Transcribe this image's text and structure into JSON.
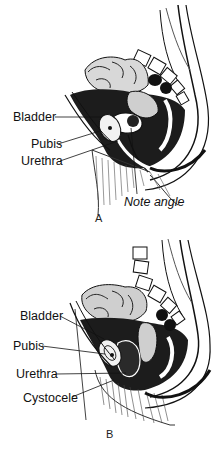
{
  "figures": [
    {
      "id": "A",
      "caption": "A",
      "description": "Sagittal section of the female pelvis showing normal anatomy",
      "labels": {
        "bladder": "Bladder",
        "pubis": "Pubis",
        "urethra": "Urethra",
        "note": "Note angle"
      }
    },
    {
      "id": "B",
      "caption": "B",
      "description": "Sagittal section of the female pelvis showing a cystocele",
      "labels": {
        "bladder": "Bladder",
        "pubis": "Pubis",
        "urethra": "Urethra",
        "cystocele": "Cystocele"
      }
    }
  ],
  "colors": {
    "ink": "#111111",
    "background": "#ffffff",
    "shade": "#3a3a3a"
  }
}
